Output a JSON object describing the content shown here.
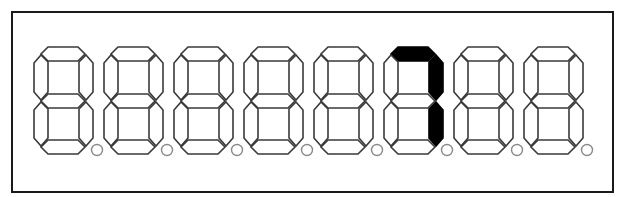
{
  "display": {
    "type": "seven-segment",
    "digit_count": 8,
    "lit_color": "#000000",
    "unlit_fill": "#ffffff",
    "outline_color": "#3a3a3a",
    "frame_color": "#1a1a1a",
    "digits": [
      {
        "index": 1,
        "value": "",
        "segments_on": [],
        "dp_on": false
      },
      {
        "index": 2,
        "value": "",
        "segments_on": [],
        "dp_on": false
      },
      {
        "index": 3,
        "value": "",
        "segments_on": [],
        "dp_on": false
      },
      {
        "index": 4,
        "value": "",
        "segments_on": [],
        "dp_on": false
      },
      {
        "index": 5,
        "value": "",
        "segments_on": [],
        "dp_on": false
      },
      {
        "index": 6,
        "value": "7",
        "segments_on": [
          "a",
          "b",
          "c"
        ],
        "dp_on": false
      },
      {
        "index": 7,
        "value": "",
        "segments_on": [],
        "dp_on": false
      },
      {
        "index": 8,
        "value": "",
        "segments_on": [],
        "dp_on": false
      }
    ]
  }
}
